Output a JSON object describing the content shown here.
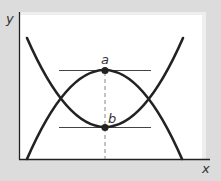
{
  "diagram": {
    "axes": {
      "x_label": "x",
      "y_label": "y"
    },
    "points": {
      "a": {
        "label": "a",
        "x": 105,
        "y": 70
      },
      "b": {
        "label": "b",
        "x": 105,
        "y": 127
      }
    },
    "colors": {
      "background": "#dcdcdc",
      "panel": "#ffffff",
      "curve": "#222222",
      "tangent": "#444444",
      "dashed": "#888888",
      "label": "#333333"
    },
    "curves": [
      {
        "name": "upward-parabola",
        "vertex": "b",
        "description": "U-shaped curve with minimum at b"
      },
      {
        "name": "downward-parabola",
        "vertex": "a",
        "description": "inverted curve with maximum at a"
      }
    ],
    "annotations": [
      "horizontal tangent line at a",
      "horizontal tangent line at b",
      "vertical dashed line through a and b to x-axis"
    ]
  }
}
